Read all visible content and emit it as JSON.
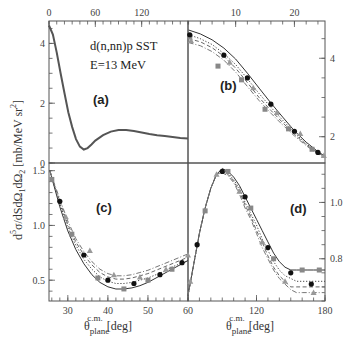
{
  "chart_data": {
    "type": "line",
    "figure": "four-panel cross section plot",
    "annotation": {
      "reaction": "d(n,nn)p   SST",
      "energy": "E=13 MeV"
    },
    "ylabel": "d⁵σ/dSdΩ₁dΩ₂ [mb/MeVsr²]",
    "ylabel_parts": {
      "base": "d",
      "sup": "5",
      "rest": "σ/dSdΩ",
      "sub1": "1",
      "mid": "dΩ",
      "sub2": "2",
      "units": " [mb/MeV sr",
      "units_sup": "2",
      "units_end": "]"
    },
    "xlabel": "θplane c.m. [deg]",
    "xlabel_parts": {
      "theta": "θ",
      "sub": "plane",
      "sup": "c.m.",
      "units": "[deg]"
    },
    "panels": [
      {
        "id": "a",
        "label": "(a)",
        "xaxis": "top",
        "yaxis": "left",
        "xlim": [
          0,
          180
        ],
        "ylim": [
          0,
          4.75
        ],
        "xticks": [
          0,
          60,
          120
        ],
        "yticks": [
          0,
          2,
          4
        ],
        "series": [
          {
            "name": "curve",
            "x": [
              0,
              5,
              10,
              15,
              20,
              25,
              30,
              35,
              40,
              45,
              50,
              55,
              60,
              70,
              80,
              90,
              100,
              110,
              120,
              130,
              140,
              150,
              160,
              170,
              180
            ],
            "y": [
              4.6,
              4.3,
              3.7,
              3.0,
              2.35,
              1.7,
              1.2,
              0.8,
              0.55,
              0.45,
              0.5,
              0.62,
              0.75,
              0.93,
              1.05,
              1.1,
              1.1,
              1.07,
              1.02,
              0.97,
              0.93,
              0.9,
              0.87,
              0.84,
              0.82
            ]
          }
        ]
      },
      {
        "id": "b",
        "label": "(b)",
        "xaxis": "top",
        "yaxis": "right",
        "xlim": [
          1.9,
          25.2
        ],
        "ylim": [
          1.33,
          4.95
        ],
        "xticks": [
          10,
          20
        ],
        "yticks": [
          2,
          4
        ],
        "series": [
          {
            "name": "solid",
            "style": "solid",
            "x": [
              2,
              4,
              6,
              8,
              10,
              12,
              14,
              16,
              18,
              20,
              22,
              24,
              25
            ],
            "y": [
              4.72,
              4.62,
              4.47,
              4.26,
              3.98,
              3.62,
              3.24,
              2.86,
              2.5,
              2.15,
              1.86,
              1.62,
              1.52
            ]
          },
          {
            "name": "dotted",
            "style": "dotted",
            "x": [
              2,
              4,
              6,
              8,
              10,
              12,
              14,
              16,
              18,
              20,
              22,
              24,
              25
            ],
            "y": [
              4.6,
              4.5,
              4.35,
              4.12,
              3.84,
              3.48,
              3.1,
              2.75,
              2.42,
              2.1,
              1.82,
              1.6,
              1.52
            ]
          },
          {
            "name": "dashed",
            "style": "dashed",
            "x": [
              2,
              4,
              6,
              8,
              10,
              12,
              14,
              16,
              18,
              20,
              22,
              24,
              25
            ],
            "y": [
              4.5,
              4.42,
              4.27,
              4.05,
              3.75,
              3.38,
              3.0,
              2.67,
              2.36,
              2.06,
              1.8,
              1.58,
              1.51
            ]
          },
          {
            "name": "dash-dot",
            "style": "dashdot",
            "x": [
              2,
              4,
              6,
              8,
              10,
              12,
              14,
              16,
              18,
              20,
              22,
              24,
              25
            ],
            "y": [
              4.4,
              4.32,
              4.17,
              3.95,
              3.65,
              3.28,
              2.92,
              2.6,
              2.3,
              2.02,
              1.77,
              1.56,
              1.5
            ]
          }
        ],
        "markers": {
          "circle_filled": {
            "x": [
              2.2,
              8,
              12,
              16,
              20,
              24
            ],
            "y": [
              4.6,
              4.08,
              3.5,
              2.83,
              2.14,
              1.6
            ]
          },
          "square_gray": {
            "x": [
              2.2,
              7,
              11,
              15,
              19,
              23
            ],
            "y": [
              4.55,
              3.8,
              3.45,
              2.7,
              2.2,
              1.68
            ]
          },
          "triangle_gray": {
            "x": [
              2.4,
              9,
              13,
              17,
              21,
              25
            ],
            "y": [
              4.45,
              3.9,
              3.25,
              2.62,
              2.08,
              1.52
            ]
          }
        }
      },
      {
        "id": "c",
        "label": "(c)",
        "xaxis": "bottom",
        "yaxis": "left",
        "xlim": [
          25.3,
          60
        ],
        "ylim": [
          0.31,
          1.57
        ],
        "xticks": [
          30,
          40,
          50
        ],
        "yticks": [
          0.5,
          1.0,
          1.5
        ],
        "series": [
          {
            "name": "solid",
            "style": "solid",
            "x": [
              25.5,
              28,
              30,
              32,
              34,
              36,
              38,
              40,
              42,
              44,
              46,
              48,
              50,
              52,
              54,
              56,
              58,
              60
            ],
            "y": [
              1.5,
              1.17,
              0.95,
              0.78,
              0.65,
              0.55,
              0.48,
              0.44,
              0.42,
              0.42,
              0.43,
              0.45,
              0.48,
              0.52,
              0.56,
              0.6,
              0.64,
              0.68
            ]
          },
          {
            "name": "dotted",
            "style": "dotted",
            "x": [
              25.5,
              28,
              30,
              32,
              34,
              36,
              38,
              40,
              42,
              44,
              46,
              48,
              50,
              52,
              54,
              56,
              58,
              60
            ],
            "y": [
              1.5,
              1.2,
              0.98,
              0.82,
              0.69,
              0.6,
              0.53,
              0.49,
              0.47,
              0.47,
              0.48,
              0.5,
              0.52,
              0.55,
              0.58,
              0.62,
              0.65,
              0.68
            ]
          },
          {
            "name": "dashed",
            "style": "dashed",
            "x": [
              25.5,
              28,
              30,
              32,
              34,
              36,
              38,
              40,
              42,
              44,
              46,
              48,
              50,
              52,
              54,
              56,
              58,
              60
            ],
            "y": [
              1.5,
              1.22,
              1.01,
              0.85,
              0.73,
              0.64,
              0.57,
              0.53,
              0.51,
              0.51,
              0.52,
              0.54,
              0.56,
              0.59,
              0.62,
              0.65,
              0.68,
              0.71
            ]
          },
          {
            "name": "dash-dot",
            "style": "dashdot",
            "x": [
              25.5,
              28,
              30,
              32,
              34,
              36,
              38,
              40,
              42,
              44,
              46,
              48,
              50,
              52,
              54,
              56,
              58,
              60
            ],
            "y": [
              1.5,
              1.24,
              1.04,
              0.88,
              0.76,
              0.67,
              0.6,
              0.56,
              0.54,
              0.54,
              0.55,
              0.57,
              0.59,
              0.62,
              0.65,
              0.68,
              0.71,
              0.74
            ]
          }
        ],
        "markers": {
          "circle_filled": {
            "x": [
              28,
              34,
              40,
              46.5,
              53,
              58.5
            ],
            "y": [
              1.22,
              0.73,
              0.5,
              0.47,
              0.55,
              0.66
            ]
          },
          "square_gray": {
            "x": [
              26,
              31,
              37.5,
              44,
              50,
              56
            ],
            "y": [
              1.42,
              0.92,
              0.52,
              0.42,
              0.5,
              0.6
            ]
          },
          "triangle_gray": {
            "x": [
              29.5,
              35.5,
              41.5,
              48,
              54.5,
              60
            ],
            "y": [
              1.08,
              0.77,
              0.55,
              0.53,
              0.6,
              0.73
            ]
          }
        }
      },
      {
        "id": "d",
        "label": "(d)",
        "xaxis": "bottom",
        "yaxis": "right",
        "xlim": [
          60,
          180
        ],
        "ylim": [
          0.65,
          1.14
        ],
        "xticks": [
          60,
          120,
          180
        ],
        "yticks": [
          0.8,
          1.0
        ],
        "series": [
          {
            "name": "solid",
            "style": "solid",
            "x": [
              60,
              65,
              70,
              75,
              80,
              85,
              90,
              95,
              100,
              105,
              110,
              115,
              120,
              125,
              130,
              135,
              140,
              145,
              150,
              155,
              160,
              165,
              170,
              175,
              180
            ],
            "y": [
              0.67,
              0.78,
              0.89,
              0.98,
              1.05,
              1.1,
              1.12,
              1.11,
              1.09,
              1.06,
              1.02,
              0.98,
              0.94,
              0.9,
              0.86,
              0.82,
              0.79,
              0.77,
              0.76,
              0.76,
              0.76,
              0.76,
              0.76,
              0.76,
              0.76
            ]
          },
          {
            "name": "dotted",
            "style": "dotted",
            "x": [
              60,
              65,
              70,
              75,
              80,
              85,
              90,
              95,
              100,
              105,
              110,
              115,
              120,
              125,
              130,
              135,
              140,
              145,
              150,
              155,
              160,
              165,
              170,
              175,
              180
            ],
            "y": [
              0.67,
              0.78,
              0.89,
              0.98,
              1.05,
              1.1,
              1.115,
              1.105,
              1.08,
              1.05,
              1.0,
              0.96,
              0.92,
              0.87,
              0.83,
              0.79,
              0.76,
              0.74,
              0.73,
              0.72,
              0.72,
              0.72,
              0.72,
              0.72,
              0.72
            ]
          },
          {
            "name": "dashed",
            "style": "dashed",
            "x": [
              60,
              65,
              70,
              75,
              80,
              85,
              90,
              95,
              100,
              105,
              110,
              115,
              120,
              125,
              130,
              135,
              140,
              145,
              150,
              155,
              160,
              165,
              170,
              175,
              180
            ],
            "y": [
              0.67,
              0.78,
              0.89,
              0.98,
              1.05,
              1.1,
              1.11,
              1.1,
              1.075,
              1.04,
              0.99,
              0.95,
              0.9,
              0.86,
              0.81,
              0.77,
              0.74,
              0.72,
              0.7,
              0.7,
              0.7,
              0.7,
              0.7,
              0.7,
              0.7
            ]
          },
          {
            "name": "dash-dot",
            "style": "dashdot",
            "x": [
              60,
              65,
              70,
              75,
              80,
              85,
              90,
              95,
              100,
              105,
              110,
              115,
              120,
              125,
              130,
              135,
              140,
              145,
              150,
              155,
              160,
              165,
              170,
              175,
              180
            ],
            "y": [
              0.67,
              0.78,
              0.89,
              0.98,
              1.05,
              1.1,
              1.105,
              1.095,
              1.07,
              1.03,
              0.98,
              0.94,
              0.89,
              0.84,
              0.8,
              0.76,
              0.73,
              0.71,
              0.69,
              0.68,
              0.68,
              0.68,
              0.68,
              0.68,
              0.68
            ]
          }
        ],
        "markers": {
          "circle_filled": {
            "x": [
              68,
              90,
              110,
              130,
              150,
              168
            ],
            "y": [
              0.85,
              1.11,
              1.02,
              0.84,
              0.75,
              0.71
            ]
          },
          "square_gray": {
            "x": [
              75,
              95,
              115,
              135,
              160,
              175
            ],
            "y": [
              0.97,
              1.11,
              0.98,
              0.8,
              0.76,
              0.76
            ]
          },
          "triangle_gray": {
            "x": [
              62,
              85,
              105,
              125,
              145,
              170
            ],
            "y": [
              0.72,
              1.1,
              1.04,
              0.86,
              0.72,
              0.68
            ]
          }
        }
      }
    ]
  }
}
